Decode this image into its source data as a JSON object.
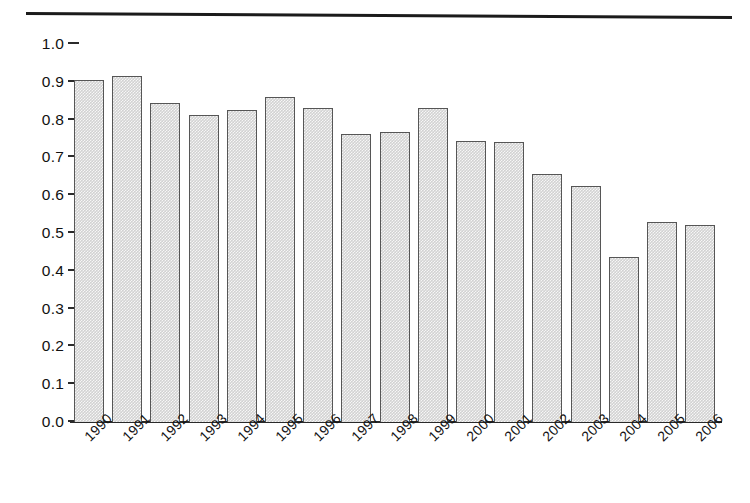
{
  "figure": {
    "has_top_rule": true,
    "background_color": "#ffffff"
  },
  "chart_data": {
    "type": "bar",
    "title": "",
    "subtitle": "",
    "xlabel": "",
    "ylabel": "",
    "categories": [
      "1990",
      "1991",
      "1992",
      "1993",
      "1994",
      "1995",
      "1996",
      "1997",
      "1998",
      "1999",
      "2000",
      "2001",
      "2002",
      "2003",
      "2004",
      "2005",
      "2006"
    ],
    "values": [
      0.905,
      0.915,
      0.845,
      0.813,
      0.825,
      0.86,
      0.83,
      0.763,
      0.768,
      0.832,
      0.744,
      0.74,
      0.655,
      0.625,
      0.437,
      0.528,
      0.52
    ],
    "ylim": [
      0.0,
      1.0
    ],
    "ytick_labels": [
      "0.0",
      "0.1",
      "0.2",
      "0.3",
      "0.4",
      "0.5",
      "0.6",
      "0.7",
      "0.8",
      "0.9",
      "1.0"
    ],
    "ytick_values": [
      0.0,
      0.1,
      0.2,
      0.3,
      0.4,
      0.5,
      0.6,
      0.7,
      0.8,
      0.9,
      1.0
    ],
    "grid": false,
    "legend": null,
    "legend_position": "none",
    "annotations": [],
    "bar_fill_color": "#d2d2d2",
    "bar_edge_color": "#565656",
    "axis_color": "#2a2a2a",
    "xtick_rotation_degrees": -45
  }
}
